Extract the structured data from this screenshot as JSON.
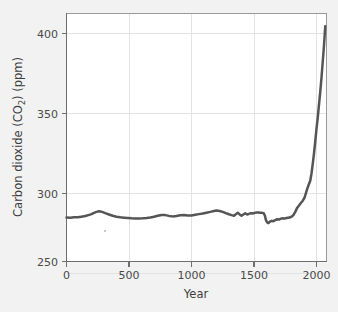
{
  "figure": {
    "background_color": "#f2f2f2",
    "plot_background_color": "#ffffff",
    "frame_color": "#9a9a9a"
  },
  "chart_data": {
    "type": "line",
    "title": "",
    "subtitle": "",
    "xlabel": "Year",
    "ylabel": "Carbon dioxide (CO2) (ppm)",
    "ylabel_parts": {
      "before": "Carbon dioxide (CO",
      "subscript": "2",
      "after": ") (ppm)"
    },
    "xlim": [
      0,
      2080
    ],
    "ylim": [
      250,
      405
    ],
    "xticks": [
      0,
      500,
      1000,
      1500,
      2000
    ],
    "xtick_labels": [
      "0",
      "500",
      "1000",
      "1500",
      "2000"
    ],
    "yticks": [
      250,
      300,
      350,
      400
    ],
    "ytick_labels": [
      "250",
      "300",
      "350",
      "400"
    ],
    "grid": true,
    "grid_color": "#e3e3e3",
    "legend": "none",
    "series": [
      {
        "name": "Atmospheric CO2 concentration",
        "color": "#555555",
        "line_width": 2.5,
        "units": "ppm",
        "x": [
          0,
          30,
          60,
          90,
          120,
          150,
          175,
          200,
          220,
          240,
          260,
          285,
          310,
          340,
          370,
          400,
          430,
          460,
          490,
          520,
          550,
          580,
          610,
          640,
          670,
          700,
          730,
          760,
          790,
          820,
          850,
          880,
          910,
          940,
          970,
          1000,
          1030,
          1060,
          1090,
          1120,
          1150,
          1180,
          1200,
          1225,
          1250,
          1275,
          1300,
          1320,
          1340,
          1355,
          1370,
          1385,
          1400,
          1415,
          1430,
          1445,
          1460,
          1475,
          1490,
          1505,
          1520,
          1535,
          1550,
          1565,
          1578,
          1588,
          1595,
          1605,
          1615,
          1625,
          1640,
          1655,
          1670,
          1685,
          1700,
          1715,
          1730,
          1745,
          1760,
          1775,
          1790,
          1800,
          1815,
          1830,
          1845,
          1860,
          1875,
          1890,
          1905,
          1920,
          1935,
          1950,
          1960,
          1970,
          1980,
          1990,
          2000,
          2010,
          2020,
          2030,
          2040,
          2050,
          2060,
          2070
        ],
        "y": [
          277.5,
          277.4,
          277.6,
          277.6,
          278.0,
          278.4,
          279.0,
          279.6,
          280.4,
          281.0,
          281.4,
          281.0,
          280.2,
          279.4,
          278.6,
          278.0,
          277.6,
          277.4,
          277.2,
          277.0,
          276.9,
          276.9,
          277.0,
          277.2,
          277.5,
          278.0,
          278.6,
          279.1,
          279.0,
          278.5,
          278.2,
          278.4,
          278.9,
          279.0,
          278.8,
          278.8,
          279.2,
          279.6,
          280.0,
          280.5,
          281.0,
          281.6,
          281.9,
          281.6,
          281.0,
          280.2,
          279.5,
          279.0,
          278.6,
          279.6,
          280.5,
          279.4,
          278.6,
          279.4,
          280.2,
          279.4,
          279.8,
          280.2,
          280.0,
          280.4,
          280.6,
          280.6,
          280.5,
          280.4,
          280.2,
          278.4,
          276.0,
          274.4,
          274.0,
          274.8,
          275.4,
          275.2,
          275.9,
          276.4,
          276.2,
          276.8,
          277.0,
          276.8,
          277.2,
          277.4,
          277.6,
          278.0,
          279.0,
          281.0,
          283.5,
          285.0,
          286.5,
          288.0,
          290.0,
          294.0,
          297.5,
          300.5,
          305.0,
          311.0,
          317.5,
          325.0,
          333.0,
          340.0,
          348.0,
          356.0,
          365.0,
          375.0,
          385.0,
          397.0
        ]
      }
    ],
    "annotations": []
  }
}
